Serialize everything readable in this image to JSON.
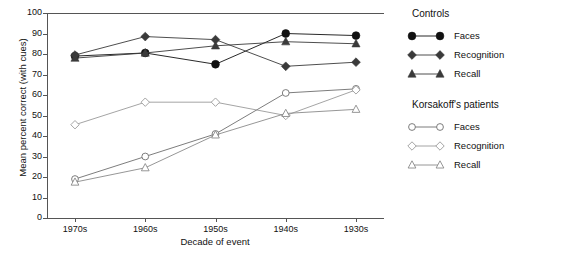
{
  "chart_data": {
    "type": "line",
    "title": "",
    "xlabel": "Decade of event",
    "ylabel": "Mean percent correct (with cues)",
    "categories": [
      "1970s",
      "1960s",
      "1950s",
      "1940s",
      "1930s"
    ],
    "ylim": [
      0,
      100
    ],
    "ytick_labels": [
      "0",
      "10",
      "20",
      "30",
      "40",
      "50",
      "60",
      "70",
      "80",
      "90",
      "100"
    ],
    "ytick_values": [
      0,
      10,
      20,
      30,
      40,
      50,
      60,
      70,
      80,
      90,
      100
    ],
    "grid": false,
    "legend_position": "right",
    "series": [
      {
        "name": "Faces",
        "group": "Controls",
        "marker": "filled-circle",
        "color": "#111111",
        "values": [
          79,
          80.5,
          75,
          90,
          89
        ]
      },
      {
        "name": "Recognition",
        "group": "Controls",
        "marker": "filled-diamond",
        "color": "#3a3a3a",
        "values": [
          79.5,
          88.5,
          87,
          74,
          76
        ]
      },
      {
        "name": "Recall",
        "group": "Controls",
        "marker": "filled-triangle",
        "color": "#3a3a3a",
        "values": [
          78,
          80.5,
          84,
          86,
          85
        ]
      },
      {
        "name": "Faces",
        "group": "Korsakoff's patients",
        "marker": "open-circle",
        "color": "#6e6e6e",
        "values": [
          19,
          30,
          41,
          61,
          63
        ]
      },
      {
        "name": "Recognition",
        "group": "Korsakoff's patients",
        "marker": "open-diamond",
        "color": "#9a9a9a",
        "values": [
          45.5,
          56.5,
          56.5,
          50,
          62.5
        ]
      },
      {
        "name": "Recall",
        "group": "Korsakoff's patients",
        "marker": "open-triangle",
        "color": "#8a8a8a",
        "values": [
          17.5,
          24.5,
          40.5,
          51,
          53
        ]
      }
    ]
  },
  "legend": {
    "group_titles": [
      "Controls",
      "Korsakoff's patients"
    ],
    "controls": [
      {
        "label": "Faces",
        "icon": "filled-circle-icon"
      },
      {
        "label": "Recognition",
        "icon": "filled-diamond-icon"
      },
      {
        "label": "Recall",
        "icon": "filled-triangle-icon"
      }
    ],
    "korsakoff": [
      {
        "label": "Faces",
        "icon": "open-circle-icon"
      },
      {
        "label": "Recognition",
        "icon": "open-diamond-icon"
      },
      {
        "label": "Recall",
        "icon": "open-triangle-icon"
      }
    ]
  },
  "colors": {
    "axis": "#555555",
    "text": "#111111",
    "controls_dark": "#111111",
    "korsakoff_light": "#8a8a8a"
  }
}
